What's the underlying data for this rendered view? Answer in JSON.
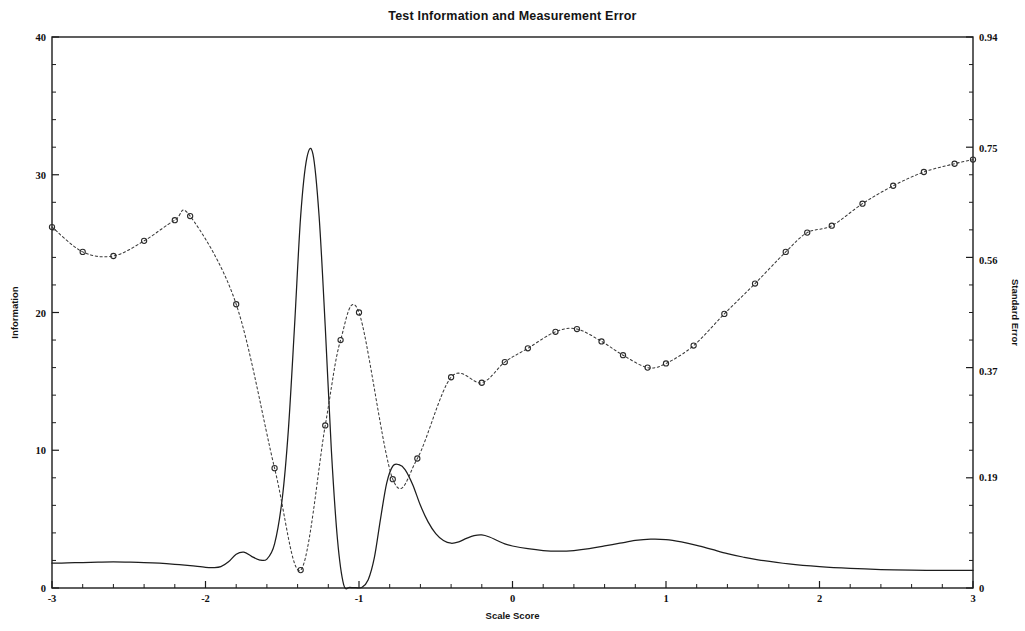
{
  "chart_data": {
    "type": "line",
    "title": "Test Information and Measurement Error",
    "xlabel": "Scale Score",
    "ylabel": "Information",
    "y2label": "Standard Error",
    "xlim": [
      -3,
      3
    ],
    "ylim": [
      0,
      40
    ],
    "y2lim": [
      0,
      0.94
    ],
    "grid": false,
    "legend": "none",
    "xticks": [
      -3,
      -2,
      -1,
      0,
      1,
      2,
      3
    ],
    "xtick_labels": [
      "-3",
      "-2",
      "-1",
      "0",
      "1",
      "2",
      "3"
    ],
    "xminor_step": 0.2,
    "yticks": [
      0,
      10,
      20,
      30,
      40
    ],
    "ytick_labels": [
      "0",
      "10",
      "20",
      "30",
      "40"
    ],
    "yminor_step": 2,
    "y2ticks": [
      0,
      0.19,
      0.37,
      0.56,
      0.75,
      0.94
    ],
    "y2tick_labels": [
      "0",
      "0.19",
      "0.37",
      "0.56",
      "0.75",
      "0.94"
    ],
    "series": [
      {
        "name": "Information",
        "axis": "left",
        "style": "solid",
        "markers": false,
        "color": "#1d1d1d",
        "x": [
          -3.0,
          -2.9,
          -2.8,
          -2.7,
          -2.6,
          -2.5,
          -2.4,
          -2.3,
          -2.2,
          -2.1,
          -2.0,
          -1.95,
          -1.9,
          -1.85,
          -1.8,
          -1.75,
          -1.7,
          -1.65,
          -1.6,
          -1.55,
          -1.5,
          -1.46,
          -1.42,
          -1.38,
          -1.34,
          -1.3,
          -1.26,
          -1.22,
          -1.18,
          -1.14,
          -1.1,
          -1.06,
          -1.02,
          -0.98,
          -0.94,
          -0.9,
          -0.86,
          -0.82,
          -0.78,
          -0.74,
          -0.7,
          -0.65,
          -0.6,
          -0.55,
          -0.5,
          -0.45,
          -0.4,
          -0.35,
          -0.3,
          -0.25,
          -0.2,
          -0.15,
          -0.1,
          -0.05,
          0.0,
          0.1,
          0.2,
          0.3,
          0.4,
          0.5,
          0.6,
          0.7,
          0.8,
          0.9,
          1.0,
          1.1,
          1.2,
          1.3,
          1.4,
          1.5,
          1.6,
          1.8,
          2.0,
          2.2,
          2.4,
          2.6,
          2.8,
          3.0
        ],
        "y": [
          1.8,
          1.82,
          1.85,
          1.88,
          1.9,
          1.88,
          1.85,
          1.8,
          1.72,
          1.62,
          1.5,
          1.48,
          1.55,
          1.9,
          2.45,
          2.6,
          2.3,
          2.05,
          2.1,
          3.2,
          6.5,
          11.5,
          19.0,
          27.0,
          31.2,
          31.5,
          27.0,
          19.0,
          10.0,
          3.5,
          0.25,
          0.05,
          0.02,
          0.05,
          0.6,
          2.2,
          5.0,
          7.6,
          8.85,
          8.95,
          8.6,
          7.5,
          6.0,
          4.8,
          3.95,
          3.45,
          3.25,
          3.35,
          3.6,
          3.8,
          3.85,
          3.7,
          3.45,
          3.2,
          3.05,
          2.85,
          2.72,
          2.68,
          2.72,
          2.85,
          3.05,
          3.25,
          3.45,
          3.55,
          3.52,
          3.35,
          3.1,
          2.8,
          2.5,
          2.25,
          2.05,
          1.75,
          1.55,
          1.42,
          1.34,
          1.3,
          1.28,
          1.28
        ]
      },
      {
        "name": "Standard Error",
        "axis": "right",
        "style": "dotted",
        "markers": true,
        "marker": "open-circle",
        "color": "#3a3a3a",
        "x": [
          -3.0,
          -2.8,
          -2.6,
          -2.4,
          -2.2,
          -2.1,
          -1.8,
          -1.55,
          -1.38,
          -1.22,
          -1.12,
          -1.0,
          -0.78,
          -0.62,
          -0.4,
          -0.2,
          -0.05,
          0.1,
          0.28,
          0.42,
          0.58,
          0.72,
          0.88,
          1.0,
          1.18,
          1.38,
          1.58,
          1.78,
          1.92,
          2.08,
          2.28,
          2.48,
          2.68,
          2.88,
          3.0
        ],
        "y_information_scale": [
          26.2,
          24.4,
          24.1,
          25.2,
          26.7,
          27.0,
          20.6,
          8.7,
          1.3,
          11.8,
          18.0,
          20.0,
          7.9,
          9.4,
          15.3,
          14.9,
          16.4,
          17.4,
          18.6,
          18.8,
          17.9,
          16.9,
          16.0,
          16.3,
          17.6,
          19.9,
          22.1,
          24.4,
          25.8,
          26.3,
          27.9,
          29.2,
          30.2,
          30.8,
          31.1
        ],
        "y": [
          0.616,
          0.573,
          0.566,
          0.592,
          0.627,
          0.634,
          0.484,
          0.204,
          0.031,
          0.277,
          0.423,
          0.47,
          0.186,
          0.221,
          0.359,
          0.35,
          0.385,
          0.409,
          0.437,
          0.442,
          0.421,
          0.397,
          0.376,
          0.383,
          0.414,
          0.468,
          0.519,
          0.573,
          0.606,
          0.618,
          0.656,
          0.686,
          0.71,
          0.724,
          0.731
        ]
      }
    ]
  },
  "axes": {
    "left_title": "Information",
    "right_title": "Standard Error",
    "bottom_title": "Scale Score"
  }
}
